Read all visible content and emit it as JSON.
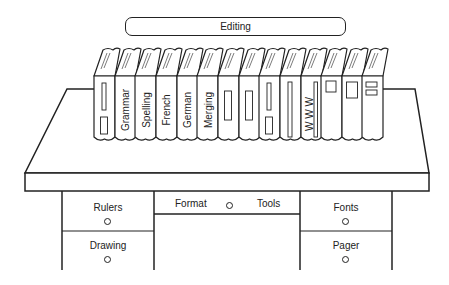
{
  "colors": {
    "line": "#222222",
    "background": "#ffffff"
  },
  "top_bar": {
    "label": "Editing"
  },
  "books": [
    {
      "id": "book-1",
      "label": "",
      "icon": "bar-and-box-icon"
    },
    {
      "id": "book-grammar",
      "label": "Grammar",
      "icon": ""
    },
    {
      "id": "book-spelling",
      "label": "Spelling",
      "icon": ""
    },
    {
      "id": "book-french",
      "label": "French",
      "icon": ""
    },
    {
      "id": "book-german",
      "label": "German",
      "icon": ""
    },
    {
      "id": "book-merging",
      "label": "Merging",
      "icon": ""
    },
    {
      "id": "book-7",
      "label": "",
      "icon": "rectangle-icon"
    },
    {
      "id": "book-8",
      "label": "",
      "icon": "rectangle-icon"
    },
    {
      "id": "book-9",
      "label": "",
      "icon": "bar-and-box-icon"
    },
    {
      "id": "book-10",
      "label": "",
      "icon": "tall-bar-icon"
    },
    {
      "id": "book-www",
      "label": "W W W",
      "icon": "tall-bar-icon"
    },
    {
      "id": "book-12",
      "label": "",
      "icon": "small-square-icon"
    },
    {
      "id": "book-13",
      "label": "",
      "icon": "large-box-icon"
    },
    {
      "id": "book-14",
      "label": "",
      "icon": "stacked-boxes-icon"
    }
  ],
  "drawers": {
    "left_top": {
      "label": "Rulers"
    },
    "left_bottom": {
      "label": "Drawing"
    },
    "center": {
      "label_left": "Format",
      "label_right": "Tools"
    },
    "right_top": {
      "label": "Fonts"
    },
    "right_bottom": {
      "label": "Pager"
    }
  }
}
